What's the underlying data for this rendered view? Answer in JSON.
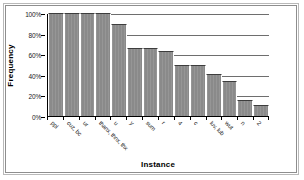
{
  "chart_data": {
    "type": "bar",
    "title": "",
    "xlabel": "Instance",
    "ylabel": "Frequency",
    "ylim": [
      0,
      100
    ],
    "ytick_labels": [
      "100%",
      "80%",
      "60%",
      "40%",
      "20%",
      "0%"
    ],
    "ytick_values": [
      100,
      80,
      60,
      40,
      20,
      0
    ],
    "grid": true,
    "legend": "none",
    "categories": [
      "ppl",
      "cuz, bc",
      "ur",
      "thanx, thnx, thx",
      "u",
      "y",
      "sum",
      "r",
      "4",
      "c",
      "luv, lub",
      "wut",
      "n",
      "2"
    ],
    "values": [
      100,
      100,
      100,
      100,
      89,
      66,
      66,
      63,
      50,
      50,
      41,
      34,
      16,
      11
    ],
    "bar_color": "#8a8a8a",
    "grid_color": "#6e6e6e",
    "axis_color": "#000000"
  }
}
